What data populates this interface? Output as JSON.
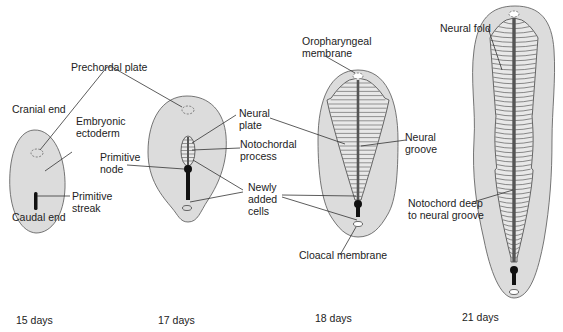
{
  "colors": {
    "embryo_fill": "#dcdcdc",
    "embryo_stroke": "#555555",
    "plate_fill": "#e8e8e8",
    "streak": "#111111",
    "notochord": "#555555",
    "leader": "#333333",
    "text": "#222222"
  },
  "stages": [
    {
      "id": "day15",
      "label": "15 days"
    },
    {
      "id": "day17",
      "label": "17 days"
    },
    {
      "id": "day18",
      "label": "18 days"
    },
    {
      "id": "day21",
      "label": "21 days"
    }
  ],
  "labels": {
    "prechordal_plate": "Prechordal plate",
    "cranial_end": "Cranial end",
    "embryonic_ectoderm": "Embryonic\nectoderm",
    "primitive_streak": "Primitive\nstreak",
    "caudal_end": "Caudal end",
    "primitive_node": "Primitive\nnode",
    "neural_plate": "Neural\nplate",
    "notochordal_process": "Notochordal\nprocess",
    "newly_added_cells": "Newly\nadded\ncells",
    "oropharyngeal_membrane": "Oropharyngeal\nmembrane",
    "neural_groove": "Neural\ngroove",
    "cloacal_membrane": "Cloacal membrane",
    "neural_fold": "Neural fold",
    "notochord_deep": "Notochord deep\nto neural groove"
  }
}
